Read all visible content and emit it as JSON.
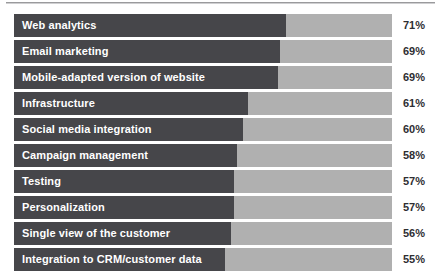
{
  "chart_data": {
    "type": "bar",
    "orientation": "horizontal",
    "title": "",
    "subtitle": "",
    "xlabel": "",
    "ylabel": "",
    "legend": [],
    "grid": false,
    "xlim": [
      0,
      100
    ],
    "value_suffix": "%",
    "categories": [
      "Web analytics",
      "Email marketing",
      "Mobile-adapted version of website",
      "Infrastructure",
      "Social media integration",
      "Campaign management",
      "Testing",
      "Personalization",
      "Single view of the customer",
      "Integration to CRM/customer data"
    ],
    "values": [
      71,
      69,
      69,
      61,
      60,
      58,
      57,
      57,
      56,
      55
    ],
    "value_labels": [
      "71%",
      "69%",
      "69%",
      "61%",
      "60%",
      "58%",
      "57%",
      "57%",
      "56%",
      "55%"
    ],
    "bar_fill_fraction": [
      0.72,
      0.704,
      0.698,
      0.619,
      0.606,
      0.59,
      0.582,
      0.582,
      0.574,
      0.558
    ],
    "colors": {
      "bar_fill": "#46464a",
      "bar_track": "#b0b0b0",
      "value_text": "#2e2e32",
      "label_text": "#ffffff",
      "background": "#ffffff",
      "rule": "#9a9a9c"
    },
    "rows": [
      {
        "label": "Web analytics",
        "value": 71,
        "value_label": "71%",
        "fill": 0.72
      },
      {
        "label": "Email marketing",
        "value": 69,
        "value_label": "69%",
        "fill": 0.704
      },
      {
        "label": "Mobile-adapted version of website",
        "value": 69,
        "value_label": "69%",
        "fill": 0.698
      },
      {
        "label": "Infrastructure",
        "value": 61,
        "value_label": "61%",
        "fill": 0.619
      },
      {
        "label": "Social media integration",
        "value": 60,
        "value_label": "60%",
        "fill": 0.606
      },
      {
        "label": "Campaign management",
        "value": 58,
        "value_label": "58%",
        "fill": 0.59
      },
      {
        "label": "Testing",
        "value": 57,
        "value_label": "57%",
        "fill": 0.582
      },
      {
        "label": "Personalization",
        "value": 57,
        "value_label": "57%",
        "fill": 0.582
      },
      {
        "label": "Single view of the customer",
        "value": 56,
        "value_label": "56%",
        "fill": 0.574
      },
      {
        "label": "Integration to CRM/customer data",
        "value": 55,
        "value_label": "55%",
        "fill": 0.558
      }
    ]
  }
}
